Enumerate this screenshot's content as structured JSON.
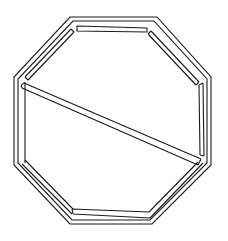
{
  "figure": {
    "type": "line-drawing",
    "width": 228,
    "height": 241,
    "background": "#ffffff",
    "stroke_color": "#1a1a1a",
    "stroke_width": 1.1
  },
  "shapes": {
    "outer_octagon": "70,17 157,17 211,77 211,165 152,224 70,224 14,165 14,77",
    "middle_octagon": "73,21 154,21 207,79 207,163 150,220 72,220 18,163 18,79",
    "inner_left_edge": "M25,82 L25,163 M22,164 L72,214 M25,160 L73,209",
    "inner_bottom_edge": "M72,209 L149,212 M73,214 L150,218 M72,209 L73,214",
    "inner_right_bottom": "M198,162 L149,212 M203,163 L150,218",
    "top_bar": "77,26 147,28 147,32 77,31",
    "left_top_bar": "M71,29 L25,77 M74,32 L28,80 M71,29 L74,32 M25,77 L28,80",
    "right_top_bar": "M151,31 L199,82 M148,34 L196,85 M151,31 L148,34 M199,82 L196,85",
    "right_vertical_bar": "M199,85 L200,155 M203,83 L204,156 M199,85 L203,83 M200,155 L204,156",
    "diagonal_bar": "M24,83 L201,159 M22,88 L198,165 M24,83 Q20,85 22,88 M201,159 L198,165"
  }
}
